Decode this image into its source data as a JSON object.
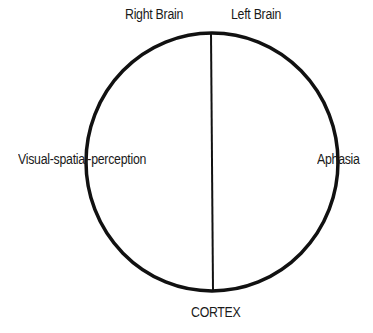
{
  "diagram": {
    "title": "",
    "shape": "circle-divided-vertically",
    "stroke_color": "#111111",
    "background_color": "#ffffff",
    "labels": {
      "top_left": "Right Brain",
      "top_right": "Left Brain",
      "left": "Visual-spatial-perception",
      "right": "Aphasia",
      "bottom": "CORTEX"
    },
    "regions": [
      {
        "side": "left",
        "name": "Right Brain",
        "function": "Visual-spatial-perception"
      },
      {
        "side": "right",
        "name": "Left Brain",
        "function": "Aphasia"
      }
    ]
  }
}
